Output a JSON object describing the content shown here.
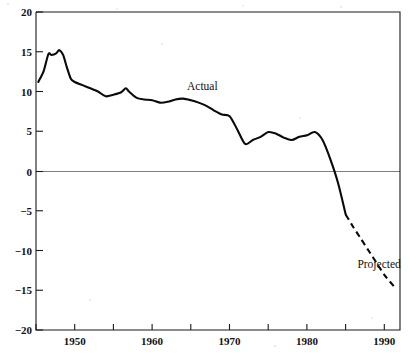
{
  "chart_data": {
    "type": "line",
    "title": "",
    "subtitle": "",
    "xlabel": "",
    "ylabel": "",
    "xlim": [
      1945,
      1992
    ],
    "ylim": [
      -20,
      20
    ],
    "grid": false,
    "zero_line": true,
    "legend_position": "inline-annotation",
    "x_ticks_major": [
      1950,
      1960,
      1970,
      1980,
      1990
    ],
    "x_tick_labels": [
      "1950",
      "1960",
      "1970",
      "1980",
      "1990"
    ],
    "x_ticks_minor": [
      1945,
      1955,
      1965,
      1975,
      1985
    ],
    "y_ticks": [
      20,
      15,
      10,
      5,
      0,
      -5,
      -10,
      -15,
      -20
    ],
    "y_tick_labels": [
      "20",
      "15",
      "10",
      "5",
      "0",
      "−5",
      "−10",
      "−15",
      "−20"
    ],
    "annotations": [
      {
        "text": "Actual",
        "x": 1964.5,
        "y": 10.2
      },
      {
        "text": "Projected",
        "x": 1986.5,
        "y": -12.2
      }
    ],
    "series": [
      {
        "name": "Actual",
        "style": "solid",
        "color": "#0a0a0a",
        "x": [
          1945.3,
          1946,
          1946.6,
          1947,
          1947.6,
          1948,
          1948.5,
          1949,
          1949.5,
          1950,
          1951,
          1952,
          1953,
          1954,
          1955,
          1956,
          1956.6,
          1957,
          1958,
          1959,
          1960,
          1961,
          1962,
          1963,
          1964,
          1965,
          1966,
          1967,
          1968,
          1969,
          1970,
          1971,
          1972,
          1973,
          1974,
          1975,
          1976,
          1977,
          1978,
          1979,
          1980,
          1981,
          1982,
          1983,
          1984,
          1985
        ],
        "y": [
          11.2,
          12.6,
          14.7,
          14.6,
          14.8,
          15.2,
          14.6,
          13.0,
          11.6,
          11.2,
          10.8,
          10.4,
          10.0,
          9.4,
          9.6,
          9.9,
          10.4,
          10.0,
          9.2,
          9.0,
          8.9,
          8.6,
          8.7,
          9.0,
          9.1,
          8.9,
          8.6,
          8.2,
          7.6,
          7.1,
          6.9,
          5.2,
          3.4,
          3.9,
          4.3,
          4.9,
          4.7,
          4.2,
          3.9,
          4.3,
          4.5,
          4.9,
          3.9,
          1.5,
          -1.5,
          -5.5
        ]
      },
      {
        "name": "Projected",
        "style": "dashed",
        "color": "#0a0a0a",
        "x": [
          1985,
          1986,
          1987,
          1988,
          1989,
          1990,
          1991.2
        ],
        "y": [
          -5.5,
          -7.1,
          -8.6,
          -10.1,
          -11.6,
          -13.1,
          -14.5
        ]
      }
    ]
  },
  "axis": {
    "y_title": "",
    "x_title": ""
  }
}
